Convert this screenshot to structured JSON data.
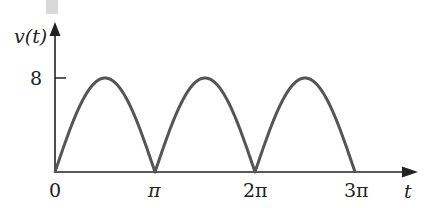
{
  "chart_data": {
    "type": "line",
    "title": "",
    "xlabel": "t",
    "ylabel": "v(t)",
    "x_ticks": [
      {
        "value": 0,
        "label": "0"
      },
      {
        "value": 3.14159,
        "label": "π"
      },
      {
        "value": 6.28318,
        "label": "2π"
      },
      {
        "value": 9.42478,
        "label": "3π"
      }
    ],
    "y_ticks": [
      {
        "value": 8,
        "label": "8"
      }
    ],
    "xlim": [
      0,
      10.9
    ],
    "ylim": [
      0,
      11.5
    ],
    "grid": false,
    "series": [
      {
        "name": "v(t)",
        "amplitude": 8,
        "function": "8*|sin(t)|",
        "x": [
          0,
          0.785,
          1.571,
          2.356,
          3.142,
          3.927,
          4.712,
          5.498,
          6.283,
          7.069,
          7.854,
          8.639,
          9.425
        ],
        "values": [
          0,
          5.66,
          8,
          5.66,
          0,
          5.66,
          8,
          5.66,
          0,
          5.66,
          8,
          5.66,
          0
        ]
      }
    ]
  },
  "labels": {
    "y_axis": "v(t)",
    "x_axis": "t",
    "y_tick_8": "8",
    "x_tick_0": "0",
    "x_tick_pi": "π",
    "x_tick_2pi": "2π",
    "x_tick_3pi": "3π"
  },
  "colors": {
    "curve": "#555555",
    "axis": "#222222"
  }
}
